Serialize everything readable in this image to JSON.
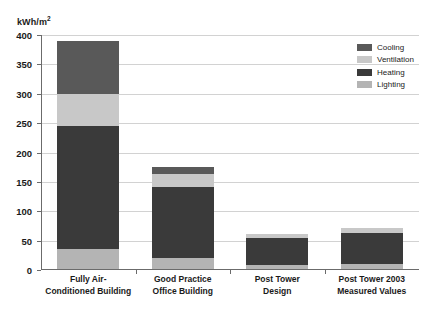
{
  "chart_data": {
    "type": "bar",
    "subtype": "stacked-bar",
    "title": "",
    "xlabel": "",
    "ylabel": "kWh/m²",
    "ylabel_base": "kWh/m",
    "ylabel_sup": "2",
    "ylim": [
      0,
      400
    ],
    "ytick_step": 50,
    "yticks": [
      0,
      50,
      100,
      150,
      200,
      250,
      300,
      350,
      400
    ],
    "ytick_labels": [
      "0",
      "50",
      "100",
      "150",
      "200",
      "250",
      "300",
      "350",
      "400"
    ],
    "grid": true,
    "grid_axis": "y",
    "legend_position": "top-right",
    "categories": [
      "Fully Air-Conditioned Building",
      "Good Practice Office Building",
      "Post Tower Design",
      "Post Tower 2003 Measured Values"
    ],
    "category_label_lines": [
      [
        "Fully Air-",
        "Conditioned Building"
      ],
      [
        "Good Practice",
        "Office Building"
      ],
      [
        "Post Tower",
        "Design"
      ],
      [
        "Post Tower 2003",
        "Measured Values"
      ]
    ],
    "stack_order_bottom_to_top": [
      "Lighting",
      "Heating",
      "Ventilation",
      "Cooling"
    ],
    "series": [
      {
        "name": "Cooling",
        "color": "#595959",
        "values": [
          90,
          12,
          0,
          0
        ]
      },
      {
        "name": "Ventilation",
        "color": "#c8c8c8",
        "values": [
          55,
          22,
          7,
          8
        ]
      },
      {
        "name": "Heating",
        "color": "#3a3a3a",
        "values": [
          210,
          121,
          47,
          53
        ]
      },
      {
        "name": "Lighting",
        "color": "#b4b4b4",
        "values": [
          35,
          20,
          8,
          10
        ]
      }
    ],
    "totals": [
      390,
      175,
      62,
      71
    ],
    "legend_entries": [
      {
        "label": "Cooling",
        "color": "#595959"
      },
      {
        "label": "Ventilation",
        "color": "#c8c8c8"
      },
      {
        "label": "Heating",
        "color": "#3a3a3a"
      },
      {
        "label": "Lighting",
        "color": "#b4b4b4"
      }
    ],
    "axis_color": "#6b6b6b",
    "gridline_color": "#d2d2d2",
    "background": "#ffffff"
  }
}
